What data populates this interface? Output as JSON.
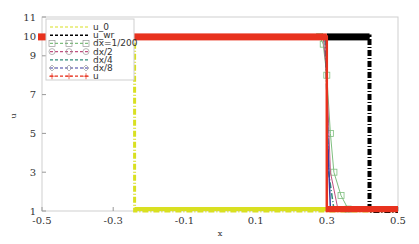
{
  "chart_data": {
    "type": "line",
    "title": "",
    "xlabel": "x",
    "ylabel": "u",
    "xlim": [
      -0.5,
      0.5
    ],
    "ylim": [
      1,
      11
    ],
    "xticks": [
      "-0.5",
      "-0.3",
      "-0.1",
      "0.1",
      "0.3",
      "0.5"
    ],
    "yticks": [
      "1",
      "3",
      "5",
      "7",
      "9",
      "10",
      "11"
    ],
    "grid": false,
    "legend_position": "upper left",
    "series": [
      {
        "name": "u_0",
        "color": "#d9e021",
        "style": "dash-dot",
        "x": [
          -0.5,
          -0.24,
          -0.24,
          0.5
        ],
        "y": [
          10,
          10,
          1,
          1
        ]
      },
      {
        "name": "u_wr",
        "color": "#000000",
        "style": "dash-dot",
        "x": [
          -0.5,
          0.42,
          0.42,
          0.5
        ],
        "y": [
          10,
          10,
          1,
          1
        ]
      },
      {
        "name": "dx=1/200",
        "color": "#7fbf7f",
        "marker": "square",
        "x": [
          -0.5,
          0.28,
          0.29,
          0.3,
          0.31,
          0.32,
          0.34,
          0.36,
          0.5
        ],
        "y": [
          10,
          10,
          9.6,
          8,
          5,
          3,
          1.8,
          1.1,
          1
        ]
      },
      {
        "name": "dx/2",
        "color": "#c05080",
        "marker": "circle",
        "x": [
          -0.5,
          0.29,
          0.3,
          0.31,
          0.33,
          0.5
        ],
        "y": [
          10,
          10,
          8,
          3,
          1.2,
          1
        ]
      },
      {
        "name": "dx/4",
        "color": "#2e8b7a",
        "style": "dash-dot",
        "x": [
          -0.5,
          0.295,
          0.3,
          0.305,
          0.32,
          0.5
        ],
        "y": [
          10,
          10,
          7,
          3,
          1.1,
          1
        ]
      },
      {
        "name": "dx/8",
        "color": "#3a3aa0",
        "marker": "diamond",
        "x": [
          -0.5,
          0.298,
          0.302,
          0.31,
          0.5
        ],
        "y": [
          10,
          10,
          5,
          1.1,
          1
        ]
      },
      {
        "name": "u",
        "color": "#e8321e",
        "marker": "plus",
        "x": [
          -0.5,
          0.3,
          0.3,
          0.5
        ],
        "y": [
          10,
          10,
          1,
          1
        ]
      }
    ]
  },
  "legend": {
    "items": [
      {
        "label": "u_0",
        "color": "#d9e021"
      },
      {
        "label": "u_wr",
        "color": "#000000"
      },
      {
        "label": "dx=1/200",
        "color": "#7fbf7f"
      },
      {
        "label": "dx/2",
        "color": "#c05080"
      },
      {
        "label": "dx/4",
        "color": "#2e8b7a"
      },
      {
        "label": "dx/8",
        "color": "#3a3aa0"
      },
      {
        "label": "u",
        "color": "#e8321e"
      }
    ]
  },
  "axes": {
    "xlabel": "x",
    "ylabel": "u",
    "xtick_labels": [
      "-0.5",
      "-0.3",
      "-0.1",
      "0.1",
      "0.3",
      "0.5"
    ],
    "ytick_labels": [
      "1",
      "3",
      "5",
      "7",
      "9",
      "10",
      "11"
    ]
  }
}
